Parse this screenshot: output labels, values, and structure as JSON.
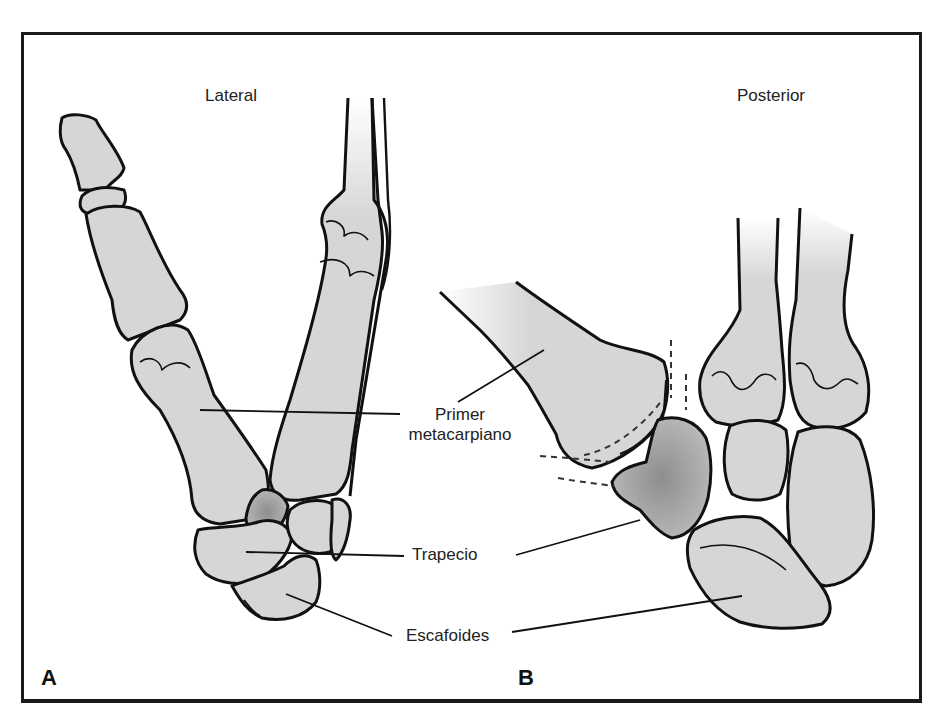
{
  "figure": {
    "panels": [
      {
        "letter": "A",
        "title": "Lateral"
      },
      {
        "letter": "B",
        "title": "Posterior"
      }
    ],
    "labels": {
      "first_metacarpal_line1": "Primer",
      "first_metacarpal_line2": "metacarpiano",
      "trapezium": "Trapecio",
      "scaphoid": "Escafoides"
    },
    "colors": {
      "bone_fill": "#d6d6d6",
      "bone_shadow": "#9a9a9a",
      "outline": "#111111",
      "frame": "#1a1a1a"
    }
  }
}
